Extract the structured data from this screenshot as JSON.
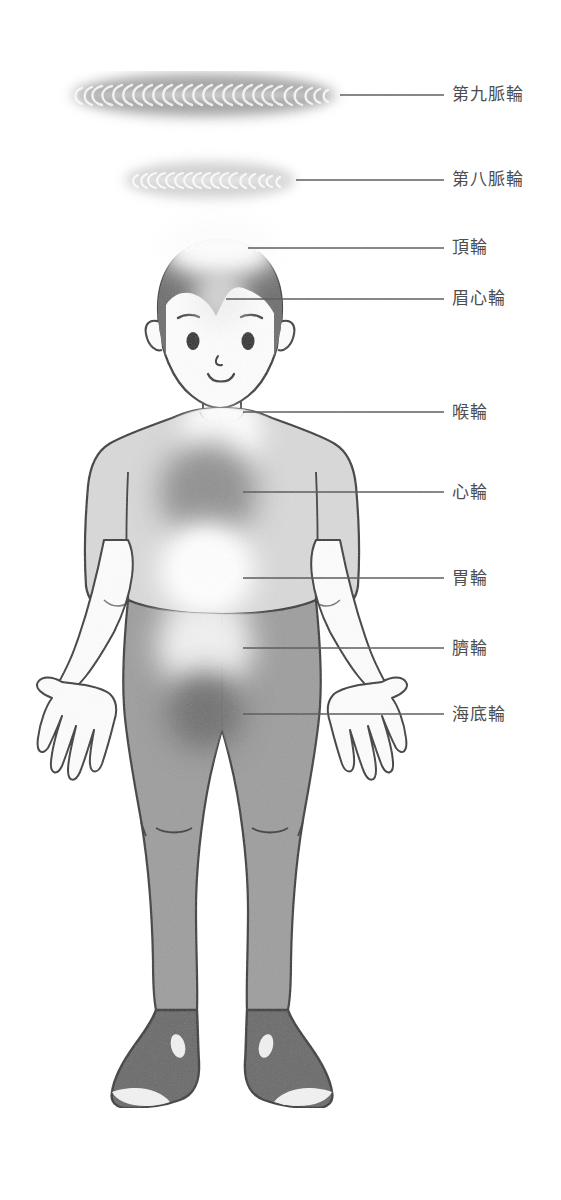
{
  "diagram": {
    "background_color": "#ffffff",
    "label_color": "#4d4d4d",
    "leader_line_color": "#55555a",
    "figure": {
      "skin_color": "#fdfdfd",
      "outline_color": "#3a3a3a",
      "hair_color": "#6e6e6e",
      "shirt_color": "#d9d9d9",
      "pants_color": "#9e9e9e",
      "shoes_color": "#6a6a6a",
      "shoe_toe_color": "#f2f2f2"
    },
    "chakras": [
      {
        "id": "ninth",
        "label": "第九脈輪",
        "type": "disc",
        "glow_color": "#8f8f8f",
        "center_x": 204,
        "center_y": 95,
        "radius_x": 133,
        "radius_y": 22,
        "label_x": 452,
        "label_y": 86,
        "line_y": 95,
        "line_x1": 340,
        "line_x2": 444
      },
      {
        "id": "eighth",
        "label": "第八脈輪",
        "type": "disc",
        "glow_color": "#d2d2d2",
        "center_x": 210,
        "center_y": 180,
        "radius_x": 85,
        "radius_y": 18,
        "label_x": 452,
        "label_y": 171,
        "line_y": 180,
        "line_x1": 296,
        "line_x2": 444
      },
      {
        "id": "crown",
        "label": "頂輪",
        "type": "glow",
        "glow_color": "#ffffff",
        "center_x": 220,
        "center_y": 246,
        "radius": 44,
        "label_x": 452,
        "label_y": 239,
        "line_y": 248,
        "line_x1": 248,
        "line_x2": 444
      },
      {
        "id": "brow",
        "label": "眉心輪",
        "type": "glow",
        "glow_color": "#e8e8e8",
        "center_x": 220,
        "center_y": 300,
        "radius": 26,
        "label_x": 452,
        "label_y": 290,
        "line_y": 299,
        "line_x1": 226,
        "line_x2": 444
      },
      {
        "id": "throat",
        "label": "喉輪",
        "type": "glow",
        "glow_color": "#ffffff",
        "center_x": 222,
        "center_y": 432,
        "radius": 36,
        "label_x": 452,
        "label_y": 404,
        "line_y": 412,
        "line_x1": 243,
        "line_x2": 444
      },
      {
        "id": "heart",
        "label": "心輪",
        "type": "glow",
        "glow_color": "#9b9b9b",
        "center_x": 208,
        "center_y": 492,
        "radius": 48,
        "label_x": 452,
        "label_y": 488,
        "line_y": 492,
        "line_x1": 243,
        "line_x2": 444
      },
      {
        "id": "stomach",
        "label": "胃輪",
        "type": "glow",
        "glow_color": "#ffffff",
        "center_x": 207,
        "center_y": 572,
        "radius": 44,
        "label_x": 452,
        "label_y": 570,
        "line_y": 578,
        "line_x1": 243,
        "line_x2": 444
      },
      {
        "id": "navel",
        "label": "臍輪",
        "type": "glow",
        "glow_color": "#e3e3e3",
        "center_x": 205,
        "center_y": 645,
        "radius": 46,
        "label_x": 452,
        "label_y": 640,
        "line_y": 648,
        "line_x1": 243,
        "line_x2": 444
      },
      {
        "id": "root",
        "label": "海底輪",
        "type": "glow",
        "glow_color": "#808080",
        "center_x": 205,
        "center_y": 712,
        "radius": 38,
        "label_x": 452,
        "label_y": 707,
        "line_y": 714,
        "line_x1": 243,
        "line_x2": 444
      }
    ]
  }
}
